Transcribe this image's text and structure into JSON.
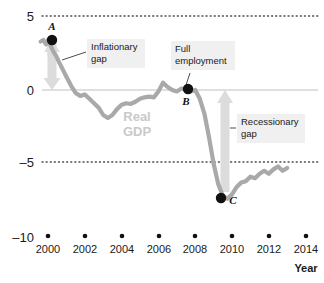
{
  "chart_data": {
    "type": "line",
    "title": "",
    "subtitle": "",
    "xlabel": "Year",
    "ylabel": "",
    "xlim": [
      1999.3,
      2014.3
    ],
    "ylim": [
      -10,
      5
    ],
    "grid": "dotted horizontal gridlines at 5 and -5; solid zero line at 0",
    "legend_position": "none",
    "series": [
      {
        "name": "Real GDP",
        "color": "#a9a9a9",
        "x": [
          1999.6,
          1999.75,
          1999.9,
          2000.0,
          2000.15,
          2000.3,
          2000.45,
          2000.6,
          2000.8,
          2001.0,
          2001.25,
          2001.5,
          2001.75,
          2002.0,
          2002.25,
          2002.5,
          2002.75,
          2003.0,
          2003.25,
          2003.5,
          2003.75,
          2004.0,
          2004.25,
          2004.5,
          2004.75,
          2005.0,
          2005.25,
          2005.5,
          2005.75,
          2006.0,
          2006.25,
          2006.5,
          2006.75,
          2007.0,
          2007.25,
          2007.5,
          2007.75,
          2008.0,
          2008.25,
          2008.5,
          2008.75,
          2009.0,
          2009.25,
          2009.5,
          2009.75,
          2010.0,
          2010.25,
          2010.5,
          2010.75,
          2011.0,
          2011.25,
          2011.5,
          2011.75,
          2012.0,
          2012.25,
          2012.5,
          2012.75,
          2013.0
        ],
        "y": [
          3.3,
          3.4,
          3.1,
          3.4,
          3.0,
          2.6,
          2.3,
          1.9,
          1.4,
          0.9,
          0.3,
          -0.2,
          -0.4,
          -0.3,
          -0.6,
          -0.9,
          -1.2,
          -1.7,
          -1.9,
          -1.7,
          -1.3,
          -1.0,
          -0.9,
          -0.95,
          -0.8,
          -0.6,
          -0.5,
          -0.45,
          -0.5,
          -0.1,
          0.5,
          0.2,
          0.0,
          -0.1,
          0.1,
          0.05,
          -0.1,
          0.0,
          -0.6,
          -1.6,
          -3.2,
          -5.0,
          -6.4,
          -7.2,
          -7.4,
          -7.1,
          -6.6,
          -6.3,
          -6.2,
          -5.9,
          -6.0,
          -5.7,
          -5.5,
          -5.7,
          -5.4,
          -5.2,
          -5.5,
          -5.3
        ]
      }
    ],
    "points": [
      {
        "label": "A",
        "x": 2000.0,
        "y": 3.4,
        "note": "Inflationary gap above potential"
      },
      {
        "label": "B",
        "x": 2008.0,
        "y": 0.0,
        "note": "Full employment"
      },
      {
        "label": "C",
        "x": 2009.75,
        "y": -7.4,
        "note": "Recessionary gap below potential"
      }
    ],
    "y_ticks": [
      "5",
      "0",
      "-5",
      "-10"
    ],
    "y_tick_values": [
      5,
      0,
      -5,
      -10
    ],
    "x_ticks": [
      "2000",
      "2002",
      "2004",
      "2006",
      "2008",
      "2010",
      "2012",
      "2014"
    ],
    "x_tick_values": [
      2000,
      2002,
      2004,
      2006,
      2008,
      2010,
      2012,
      2014
    ],
    "annotations": [
      {
        "text": "Inflationary\ngap",
        "x": 2000.0,
        "y": 1.7
      },
      {
        "text": "Full\nemployment",
        "x": 2008.0,
        "y": 2.6
      },
      {
        "text": "Recessionary\ngap",
        "x": 2010.3,
        "y": -3.2
      },
      {
        "text": "Real\nGDP",
        "x": 2003.6,
        "y": -2.5
      }
    ],
    "colors": {
      "series_line": "#a9a9a9",
      "gridline": "#4d4d4d",
      "zero_line": "#bfbfbf",
      "arrow_fill": "#dcdcdc",
      "marker": "#111111",
      "callout_background": "#f0f0f0",
      "watermark": "#c9c9c9",
      "text": "#1a1a1a"
    }
  },
  "y_axis": {
    "ticks": [
      {
        "label": "5"
      },
      {
        "label": "0"
      },
      {
        "label": "–5"
      },
      {
        "label": "–10"
      }
    ]
  },
  "x_axis": {
    "title": "Year",
    "ticks": [
      {
        "label": "2000"
      },
      {
        "label": "2002"
      },
      {
        "label": "2004"
      },
      {
        "label": "2006"
      },
      {
        "label": "2008"
      },
      {
        "label": "2010"
      },
      {
        "label": "2012"
      },
      {
        "label": "2014"
      }
    ]
  },
  "markers": {
    "a": {
      "label": "A"
    },
    "b": {
      "label": "B"
    },
    "c": {
      "label": "C"
    }
  },
  "callouts": {
    "inflationary_gap": {
      "text": "Inflationary\ngap"
    },
    "full_employment": {
      "text": "Full\nemployment"
    },
    "recessionary_gap": {
      "text": "Recessionary\ngap"
    }
  },
  "watermark": {
    "line1": "Real",
    "line2": "GDP"
  }
}
